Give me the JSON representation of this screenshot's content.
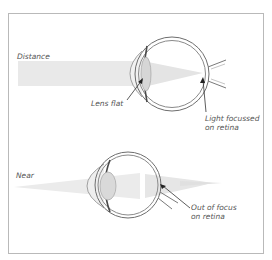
{
  "diagram": {
    "panels": [
      {
        "label": "Distance",
        "annotations": [
          {
            "text": "Lens flat"
          },
          {
            "text_line1": "Light focussed",
            "text_line2": "on retina"
          }
        ]
      },
      {
        "label": "Near",
        "annotations": [
          {
            "text_line1": "Out of focus",
            "text_line2": "on retina"
          }
        ]
      }
    ]
  },
  "colors": {
    "frame": "#b9b9b9",
    "eye_outline": "#6a6a6a",
    "light_beam": "#e6e6e6",
    "lens_fill": "#d8d8d8",
    "text": "#555555"
  }
}
